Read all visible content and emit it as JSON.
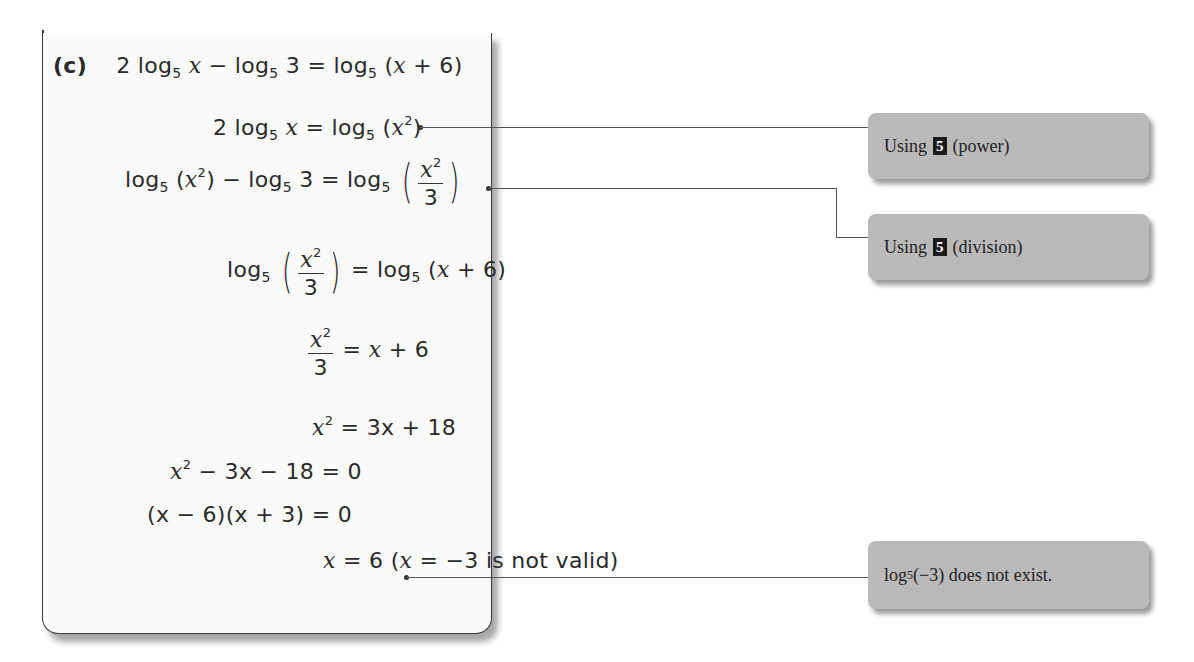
{
  "worked_example": {
    "part_label": "(c)",
    "steps": [
      {
        "id": "step1",
        "lhs": "2 log5 x − log5 3",
        "rhs": "log5 (x + 6)"
      },
      {
        "id": "step2",
        "lhs": "2 log5 x",
        "rhs": "log5 (x²)"
      },
      {
        "id": "step3",
        "lhs": "log5 (x²) − log5 3",
        "rhs": "log5 (x²/3)"
      },
      {
        "id": "step4",
        "lhs": "log5 (x²/3)",
        "rhs": "log5 (x + 6)"
      },
      {
        "id": "step5",
        "lhs": "x²/3",
        "rhs": "x + 6"
      },
      {
        "id": "step6",
        "lhs": "x²",
        "rhs": "3x + 18"
      },
      {
        "id": "step7",
        "lhs": "x² − 3x − 18",
        "rhs": "0"
      },
      {
        "id": "step8",
        "lhs": "(x − 6)(x + 3)",
        "rhs": "0"
      },
      {
        "id": "step9",
        "lhs": "x",
        "rhs": "6 (x = −3 is not valid)"
      }
    ],
    "text": {
      "two": "2",
      "log": "log",
      "base": "5",
      "x": "x",
      "minus": " − ",
      "three": "3",
      "equals": " = ",
      "open": "(",
      "close": ")",
      "plus": " + ",
      "six": "6",
      "sq": "2",
      "x_plus_6": "x + 6",
      "rhs6": "3x + 18",
      "step7_lhs": "− 3x − 18",
      "zero": "0",
      "step8_lhs": "(x − 6)(x + 3)",
      "step9_val": "6 (",
      "step9_neg": " = −3 is not valid)"
    }
  },
  "callouts": [
    {
      "prefix": "Using",
      "badge": "5",
      "suffix": "(power)"
    },
    {
      "prefix": "Using",
      "badge": "5",
      "suffix": "(division)"
    },
    {
      "log": "log",
      "base": "5",
      "suffix": " (−3) does not exist."
    }
  ]
}
